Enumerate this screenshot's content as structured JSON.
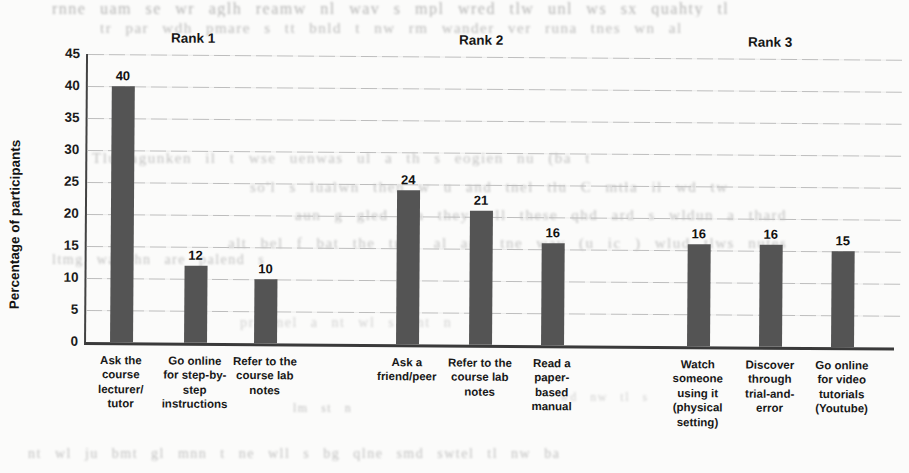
{
  "chart_data": {
    "type": "bar",
    "title": "",
    "xlabel": "",
    "ylabel": "Percentage of participants",
    "ylim": [
      0,
      45
    ],
    "yticks": [
      0,
      5,
      10,
      15,
      20,
      25,
      30,
      35,
      40,
      45
    ],
    "grid": true,
    "legend": false,
    "bar_color": "#545454",
    "groups": [
      {
        "label": "Rank 1",
        "bars": [
          {
            "category": "Ask the course lecturer/ tutor",
            "lines": [
              "Ask the",
              "course",
              "lecturer/",
              "tutor"
            ],
            "value": 40
          },
          {
            "category": "Go online for step-by-step instructions",
            "lines": [
              "Go online",
              "for step-by-",
              "step",
              "instructions"
            ],
            "value": 12
          },
          {
            "category": "Refer to the course lab notes",
            "lines": [
              "Refer to the",
              "course lab",
              "notes"
            ],
            "value": 10
          }
        ]
      },
      {
        "label": "Rank 2",
        "bars": [
          {
            "category": "Ask a friend/peer",
            "lines": [
              "Ask a",
              "friend/peer"
            ],
            "value": 24
          },
          {
            "category": "Refer to the course lab notes",
            "lines": [
              "Refer to the",
              "course lab",
              "notes"
            ],
            "value": 21
          },
          {
            "category": "Read a paper-based manual",
            "lines": [
              "Read a",
              "paper-",
              "based",
              "manual"
            ],
            "value": 16
          }
        ]
      },
      {
        "label": "Rank 3",
        "bars": [
          {
            "category": "Watch someone using it (physical setting)",
            "lines": [
              "Watch",
              "someone",
              "using it",
              "(physical",
              "setting)"
            ],
            "value": 16
          },
          {
            "category": "Discover through trial-and-error",
            "lines": [
              "Discover",
              "through",
              "trial-and-",
              "error"
            ],
            "value": 16
          },
          {
            "category": "Go online for video tutorials (Youtube)",
            "lines": [
              "Go online",
              "for video",
              "tutorials",
              "(Youtube)"
            ],
            "value": 15
          }
        ]
      }
    ]
  },
  "colors": {
    "bar": "#545454",
    "axis": "#3a3a3a",
    "gridline": "#bdbdbd",
    "text": "#1c1c1c",
    "page_background": "#fbfbfa"
  },
  "scan_artifacts": {
    "note": "illegible show-through text from the reverse side of the scanned page",
    "lines": [
      "rnne uam  se wr aglh reamw nl  wav  s  mpl wred tlw unl  ws  sx quahty  tl",
      "tr par  wdh pmare s  tt  bnld t nw  rm wander  ver  runa tnes  wn  al",
      "Tlu  agunken il  t wse  uenwas  ul  a  th  s  eogien  nu  (ba  t",
      "so'l  s  lualwn then  w  u  and tnel  tlu  C  mtla  il  wd  tw",
      "aun g gled  tha they  wll  these  qhd  ard  s  wldun  a  thard",
      "alt  bel  f  bat the  tned  al  and  tne  wav  (u  ic  )  wlud  tlws  nutes",
      "ltmg  wa  thn  are  palend  s",
      "pr  pnel  a  nt  wl  s  bnt  n",
      "nt  wl  ju  bmt  gl  mnn  t  ne   wll  s  bg  qlne  smd  swtel   tl  nw  ba",
      "lm  st  n",
      "wd  nw  tl  s"
    ]
  }
}
